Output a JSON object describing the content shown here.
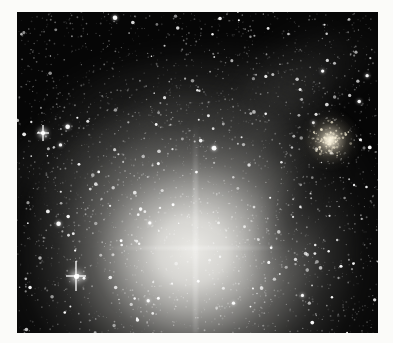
{
  "scene": {
    "kind": "telescope-photograph",
    "subject": "bright-nebula-glow-with-starfield-and-globular-cluster",
    "page_background_color": "#fbfbf9",
    "sky_color": "#060606",
    "photo": {
      "width": 361,
      "height": 321
    },
    "central_glow": {
      "x": 175,
      "y": 239,
      "rx": 215,
      "ry": 200,
      "core_color": "#efeeea",
      "stops": [
        [
          0.0,
          "rgba(239,238,234,0.98)"
        ],
        [
          0.16,
          "rgba(232,231,227,0.92)"
        ],
        [
          0.3,
          "rgba(205,204,200,0.78)"
        ],
        [
          0.46,
          "rgba(165,164,160,0.52)"
        ],
        [
          0.63,
          "rgba(115,115,112,0.30)"
        ],
        [
          0.8,
          "rgba(62,62,60,0.13)"
        ],
        [
          1.0,
          "rgba(0,0,0,0)"
        ]
      ]
    },
    "haze_blobs": [
      {
        "x": 165,
        "y": 85,
        "w": 310,
        "h": 115,
        "rot": -8,
        "color": "rgba(160,160,156,0.15)"
      },
      {
        "x": 55,
        "y": 142,
        "w": 190,
        "h": 95,
        "rot": -18,
        "color": "rgba(150,150,146,0.12)"
      },
      {
        "x": 118,
        "y": 152,
        "w": 250,
        "h": 115,
        "rot": -33,
        "color": "rgba(158,158,154,0.20)"
      },
      {
        "x": 238,
        "y": 128,
        "w": 290,
        "h": 125,
        "rot": -55,
        "color": "rgba(162,162,158,0.20)"
      },
      {
        "x": 300,
        "y": 62,
        "w": 170,
        "h": 80,
        "rot": -30,
        "color": "rgba(140,140,136,0.10)"
      }
    ],
    "dark_lane": {
      "x": 286,
      "y": 196,
      "w": 190,
      "h": 72,
      "rot": -56,
      "color": "rgba(6,6,6,0.40)"
    },
    "streak_vertical": {
      "x": 178,
      "top": 110,
      "height": 211
    },
    "streak_horizontal": {
      "y": 236,
      "left": 80,
      "width": 190
    },
    "globular_cluster": {
      "x": 313,
      "y": 128,
      "core_color": "#fff9e6",
      "stops": [
        [
          0.0,
          "rgba(255,249,230,1)"
        ],
        [
          0.1,
          "rgba(250,242,220,0.92)"
        ],
        [
          0.28,
          "rgba(222,212,188,0.55)"
        ],
        [
          0.52,
          "rgba(160,152,130,0.26)"
        ],
        [
          0.78,
          "rgba(90,86,74,0.10)"
        ],
        [
          1.0,
          "rgba(0,0,0,0)"
        ]
      ],
      "speckle_count": 90,
      "speckle_sigma": 9,
      "speckle_color": "255,248,225"
    },
    "bright_stars": [
      {
        "name": "bright-star-primary",
        "x": 59,
        "y": 264,
        "core": 5.0,
        "glow": 7,
        "spike_v": 30,
        "spike_h": 20
      },
      {
        "name": "bright-star-secondary",
        "x": 26,
        "y": 121,
        "core": 3.5,
        "glow": 5,
        "spike_v": 16,
        "spike_h": 12
      }
    ],
    "starfield": {
      "seed": 1234,
      "faint_count": 2600,
      "bright_count": 240,
      "large_count": 14,
      "star_color": "255,255,255"
    }
  }
}
